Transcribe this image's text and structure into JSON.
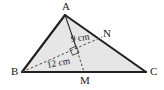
{
  "figure": {
    "type": "geometry-diagram",
    "canvas": {
      "width": 164,
      "height": 90
    },
    "colors": {
      "background": "#ffffff",
      "triangle_fill": "#e6e6e6",
      "stroke": "#231f20",
      "dashed_stroke": "#4a4a4a",
      "label_color": "#1a1a1a"
    },
    "triangle": {
      "name": "ABC",
      "vertices": [
        {
          "id": "A",
          "label": "A",
          "x": 65,
          "y": 15
        },
        {
          "id": "B",
          "label": "B",
          "x": 22,
          "y": 72
        },
        {
          "id": "C",
          "label": "C",
          "x": 146,
          "y": 72
        }
      ]
    },
    "points": [
      {
        "id": "M",
        "label": "M",
        "x": 84,
        "y": 72,
        "on": "BC"
      },
      {
        "id": "N",
        "label": "N",
        "x": 102,
        "y": 37,
        "on": "AC"
      }
    ],
    "segments": [
      {
        "id": "AB",
        "from": "A",
        "to": "B",
        "style": "solid"
      },
      {
        "id": "AC",
        "from": "A",
        "to": "C",
        "style": "solid"
      },
      {
        "id": "BC",
        "from": "B",
        "to": "C",
        "style": "solid"
      },
      {
        "id": "AM",
        "from": "A",
        "to": "M",
        "style": "solid-thin"
      },
      {
        "id": "AM_dashed",
        "from": "A",
        "to": "M",
        "style": "dashed"
      },
      {
        "id": "BN",
        "from": "B",
        "to": "N",
        "style": "dashed"
      }
    ],
    "right_angle": {
      "at": "intersection of AM and BN",
      "x": 73,
      "y": 51,
      "size": 8
    },
    "labels": {
      "vertex_a": "A",
      "vertex_b": "B",
      "vertex_c": "C",
      "point_m": "M",
      "point_n": "N"
    },
    "measurements": [
      {
        "id": "am-measure",
        "text": "9 cm",
        "segment": "AM",
        "value": 9,
        "unit": "cm",
        "x": 71,
        "y": 35,
        "rotation": -8
      },
      {
        "id": "bn-measure",
        "text": "12 cm",
        "segment": "BN",
        "value": 12,
        "unit": "cm",
        "x": 47,
        "y": 62,
        "rotation": -11
      }
    ]
  }
}
